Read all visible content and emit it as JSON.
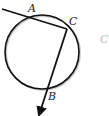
{
  "diagram": {
    "type": "geometry",
    "circle": {
      "cx": 42,
      "cy": 52,
      "r": 37
    },
    "points": [
      {
        "name": "A",
        "label": "A",
        "x": 31,
        "y": 16
      },
      {
        "name": "C",
        "label": "C",
        "x": 67,
        "y": 29
      },
      {
        "name": "B",
        "label": "B",
        "x": 47,
        "y": 89
      }
    ],
    "lines": [
      {
        "from": "outside-left",
        "through": "A",
        "to": "C"
      },
      {
        "from": "C",
        "through": "B",
        "to": "arrow-end"
      }
    ],
    "extra_label": "C",
    "colors": {
      "stroke": "#111111",
      "shadow": "#888888"
    }
  }
}
